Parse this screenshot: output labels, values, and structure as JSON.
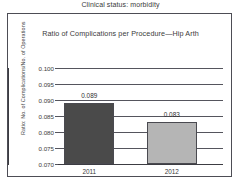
{
  "header": {
    "text": "Clinical status: morbidity"
  },
  "chart_data": {
    "type": "bar",
    "title": "Ratio of Complications per Procedure—Hip Arth",
    "xlabel": "",
    "ylabel": "Ratio: No. of Complications/No. of Operations",
    "categories": [
      "2011",
      "2012"
    ],
    "values": [
      0.089,
      0.083
    ],
    "value_labels": [
      "0.089",
      "0.083"
    ],
    "ylim": [
      0.07,
      0.1
    ],
    "ytick_labels": [
      "0.100",
      "0.095",
      "0.090",
      "0.085",
      "0.080",
      "0.075",
      "0.070"
    ],
    "ytick_values": [
      0.1,
      0.095,
      0.09,
      0.085,
      0.08,
      0.075,
      0.07
    ],
    "grid": true,
    "legend": "none",
    "bar_colors": [
      "#4a4a4a",
      "#b5b5b5"
    ],
    "series": [
      {
        "name": "Ratio of complications per procedure",
        "values": [
          0.089,
          0.083
        ]
      }
    ]
  }
}
